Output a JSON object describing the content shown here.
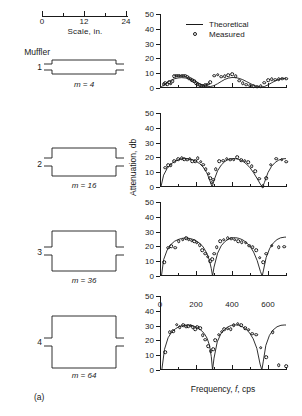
{
  "figure": {
    "panel_label": "(a)",
    "scale": {
      "title": "Scale, in.",
      "ticks": [
        0,
        12,
        24
      ],
      "tick_labels": [
        "0",
        "12",
        "24"
      ]
    },
    "muffler_header": "Muffler",
    "mufflers": [
      {
        "number": "1",
        "caption_prefix": "m",
        "caption_eq": " = 4",
        "m": 4
      },
      {
        "number": "2",
        "caption_prefix": "m",
        "caption_eq": " = 16",
        "m": 16
      },
      {
        "number": "3",
        "caption_prefix": "m",
        "caption_eq": " = 36",
        "m": 36
      },
      {
        "number": "4",
        "caption_prefix": "m",
        "caption_eq": " = 64",
        "m": 64
      }
    ],
    "legend": {
      "theoretical": "Theoretical",
      "measured": "Measured"
    },
    "axis_titles": {
      "y": "Attenuation, db",
      "x_prefix": "Frequency, ",
      "x_symbol": "f",
      "x_suffix": ", cps"
    }
  },
  "chart_data": [
    {
      "type": "line",
      "title": "",
      "panel_index": 1,
      "muffler": 1,
      "expansion_ratio_m": 4,
      "xlabel": "Frequency, f, cps",
      "ylabel": "Attenuation, db",
      "xlim": [
        0,
        700
      ],
      "ylim": [
        0,
        50
      ],
      "yticks": [
        0,
        10,
        20,
        30,
        40,
        50
      ],
      "xticks": [
        0,
        100,
        200,
        300,
        400,
        500,
        600,
        700
      ],
      "xticks_major": [
        0,
        200,
        400,
        600
      ],
      "grid": false,
      "legend": [
        "Theoretical",
        "Measured"
      ],
      "series": [
        {
          "name": "Theoretical",
          "style": "line",
          "x": [
            0,
            20,
            40,
            60,
            80,
            100,
            120,
            140,
            160,
            180,
            200,
            220,
            240,
            260,
            280,
            300,
            320,
            340,
            360,
            380,
            400,
            420,
            440,
            460,
            480,
            500,
            520,
            540,
            560,
            580,
            600,
            620,
            640,
            660,
            680,
            700
          ],
          "y": [
            0,
            2.0,
            3.8,
            5.2,
            6.2,
            6.8,
            7.0,
            6.8,
            6.3,
            5.4,
            4.2,
            3.0,
            1.9,
            1.2,
            1.0,
            1.6,
            2.9,
            4.4,
            5.8,
            6.7,
            7.1,
            7.0,
            6.5,
            5.6,
            4.4,
            3.1,
            1.9,
            1.0,
            0.6,
            1.0,
            2.1,
            3.5,
            4.8,
            5.8,
            6.4,
            6.6
          ]
        },
        {
          "name": "Measured",
          "style": "markers",
          "x": [
            20,
            30,
            40,
            50,
            60,
            70,
            80,
            90,
            100,
            110,
            120,
            130,
            140,
            150,
            160,
            170,
            180,
            190,
            200,
            210,
            220,
            230,
            240,
            250,
            260,
            270,
            280,
            300,
            320,
            340,
            360,
            380,
            400,
            420,
            440,
            460,
            480,
            500,
            520,
            540,
            560,
            580,
            600,
            620,
            640,
            660,
            680,
            700
          ],
          "y": [
            2.5,
            3.2,
            2.6,
            4.0,
            3.0,
            4.6,
            8.0,
            8.2,
            8.2,
            8.2,
            8.2,
            8.2,
            8.2,
            7.6,
            6.6,
            6.0,
            5.4,
            4.4,
            3.4,
            2.6,
            2.0,
            1.6,
            1.6,
            1.8,
            2.2,
            3.0,
            4.0,
            8.2,
            9.0,
            7.6,
            8.0,
            8.8,
            9.2,
            7.8,
            5.0,
            3.4,
            2.2,
            1.6,
            1.2,
            1.0,
            1.4,
            3.6,
            5.4,
            5.8,
            5.6,
            5.8,
            6.2,
            6.4
          ]
        }
      ]
    },
    {
      "type": "line",
      "title": "",
      "panel_index": 2,
      "muffler": 2,
      "expansion_ratio_m": 16,
      "xlabel": "Frequency, f, cps",
      "ylabel": "Attenuation, db",
      "xlim": [
        0,
        700
      ],
      "ylim": [
        0,
        50
      ],
      "yticks": [
        0,
        10,
        20,
        30,
        40,
        50
      ],
      "xticks": [
        0,
        100,
        200,
        300,
        400,
        500,
        600,
        700
      ],
      "xticks_major": [
        0,
        200,
        400,
        600
      ],
      "grid": false,
      "legend": [
        "Theoretical",
        "Measured"
      ],
      "series": [
        {
          "name": "Theoretical",
          "style": "line",
          "x": [
            5,
            20,
            40,
            60,
            80,
            100,
            120,
            140,
            160,
            180,
            200,
            220,
            240,
            260,
            275,
            285,
            290,
            300,
            320,
            340,
            360,
            380,
            400,
            420,
            440,
            460,
            480,
            500,
            520,
            540,
            560,
            570,
            580,
            600,
            620,
            640,
            660,
            680,
            700
          ],
          "y": [
            0,
            8.0,
            12.6,
            15.4,
            17.2,
            18.3,
            19.0,
            19.2,
            19.0,
            18.4,
            17.4,
            15.8,
            13.4,
            9.6,
            5.0,
            1.5,
            0,
            4.5,
            11.0,
            14.8,
            17.2,
            18.6,
            19.2,
            19.2,
            18.6,
            17.4,
            15.6,
            13.0,
            9.6,
            5.6,
            1.4,
            0,
            3.0,
            9.8,
            14.0,
            16.6,
            18.2,
            19.0,
            19.2
          ]
        },
        {
          "name": "Measured",
          "style": "markers",
          "x": [
            30,
            45,
            60,
            80,
            100,
            120,
            135,
            150,
            165,
            180,
            195,
            210,
            225,
            240,
            255,
            270,
            280,
            288,
            295,
            310,
            330,
            350,
            370,
            390,
            410,
            430,
            450,
            470,
            490,
            510,
            530,
            550,
            570,
            590,
            615,
            645,
            675,
            700
          ],
          "y": [
            13.0,
            14.8,
            14.8,
            17.6,
            18.6,
            19.6,
            18.6,
            18.4,
            19.0,
            17.4,
            17.6,
            19.6,
            17.0,
            15.0,
            12.0,
            9.0,
            6.0,
            3.0,
            4.8,
            12.0,
            17.6,
            17.8,
            19.0,
            18.4,
            18.4,
            20.0,
            18.0,
            17.8,
            16.6,
            14.2,
            10.6,
            5.6,
            0.5,
            5.8,
            15.2,
            19.0,
            18.4,
            17.0
          ]
        }
      ]
    },
    {
      "type": "line",
      "title": "",
      "panel_index": 3,
      "muffler": 3,
      "expansion_ratio_m": 36,
      "xlabel": "Frequency, f, cps",
      "ylabel": "Attenuation, db",
      "xlim": [
        0,
        700
      ],
      "ylim": [
        0,
        50
      ],
      "yticks": [
        0,
        10,
        20,
        30,
        40,
        50
      ],
      "xticks": [
        0,
        100,
        200,
        300,
        400,
        500,
        600,
        700
      ],
      "xticks_major": [
        0,
        200,
        400,
        600
      ],
      "grid": false,
      "legend": [
        "Theoretical",
        "Measured"
      ],
      "series": [
        {
          "name": "Theoretical",
          "style": "line",
          "x": [
            8,
            20,
            40,
            60,
            80,
            100,
            120,
            140,
            160,
            180,
            200,
            220,
            240,
            260,
            275,
            285,
            292,
            300,
            320,
            340,
            360,
            380,
            400,
            420,
            440,
            460,
            480,
            500,
            520,
            540,
            558,
            568,
            575,
            590,
            610,
            630,
            650,
            670,
            690,
            700
          ],
          "y": [
            0,
            11.0,
            17.6,
            21.2,
            23.4,
            24.6,
            25.4,
            25.7,
            25.5,
            24.9,
            23.8,
            22.2,
            19.6,
            15.4,
            10.4,
            5.0,
            0,
            6.0,
            15.4,
            20.4,
            23.2,
            25.0,
            25.8,
            25.9,
            25.4,
            24.4,
            22.6,
            20.0,
            16.2,
            10.4,
            3.0,
            0,
            4.0,
            12.6,
            18.8,
            22.4,
            24.6,
            25.8,
            26.2,
            26.3
          ]
        },
        {
          "name": "Measured",
          "style": "markers",
          "x": [
            22,
            45,
            62,
            85,
            105,
            125,
            145,
            160,
            175,
            190,
            205,
            220,
            235,
            250,
            265,
            278,
            290,
            300,
            315,
            335,
            355,
            375,
            395,
            415,
            435,
            455,
            475,
            495,
            515,
            535,
            555,
            572,
            590,
            620,
            660,
            690
          ],
          "y": [
            9.5,
            19.0,
            20.0,
            19.2,
            23.6,
            24.4,
            25.4,
            24.6,
            23.8,
            23.4,
            22.6,
            20.8,
            17.6,
            15.0,
            13.0,
            9.8,
            11.2,
            15.2,
            19.6,
            23.4,
            24.6,
            25.6,
            25.2,
            24.4,
            23.6,
            23.0,
            22.4,
            20.6,
            19.4,
            17.6,
            12.4,
            9.4,
            15.0,
            20.6,
            19.6,
            19.8
          ]
        }
      ]
    },
    {
      "type": "line",
      "title": "",
      "panel_index": 4,
      "muffler": 4,
      "expansion_ratio_m": 64,
      "xlabel": "Frequency, f, cps",
      "ylabel": "Attenuation, db",
      "xlim": [
        0,
        700
      ],
      "ylim": [
        0,
        50
      ],
      "yticks": [
        0,
        10,
        20,
        30,
        40,
        50
      ],
      "xticks": [
        0,
        100,
        200,
        300,
        400,
        500,
        600,
        700
      ],
      "xticks_major": [
        0,
        200,
        400,
        600
      ],
      "grid": false,
      "legend": [
        "Theoretical",
        "Measured"
      ],
      "series": [
        {
          "name": "Theoretical",
          "style": "line",
          "x": [
            10,
            25,
            45,
            65,
            85,
            105,
            125,
            145,
            165,
            185,
            205,
            225,
            245,
            262,
            275,
            285,
            292,
            300,
            318,
            338,
            358,
            378,
            398,
            418,
            438,
            458,
            478,
            498,
            518,
            538,
            556,
            566,
            574,
            588,
            608,
            628,
            650,
            672,
            690,
            700
          ],
          "y": [
            0,
            14.0,
            21.8,
            25.6,
            27.8,
            29.2,
            30.0,
            30.4,
            30.3,
            29.8,
            28.8,
            27.2,
            24.8,
            21.4,
            16.6,
            9.0,
            0,
            8.0,
            19.0,
            24.4,
            27.4,
            29.2,
            30.2,
            30.5,
            30.2,
            29.2,
            27.6,
            25.0,
            21.0,
            14.6,
            4.0,
            0,
            6.0,
            16.6,
            23.4,
            27.0,
            29.2,
            30.2,
            30.4,
            30.4
          ]
        },
        {
          "name": "Measured",
          "style": "markers",
          "x": [
            30,
            55,
            72,
            92,
            110,
            128,
            145,
            158,
            170,
            182,
            195,
            208,
            222,
            238,
            252,
            268,
            282,
            295,
            308,
            325,
            342,
            358,
            375,
            392,
            410,
            432,
            452,
            472,
            492,
            512,
            535,
            560,
            590,
            625,
            660,
            700
          ],
          "y": [
            12.0,
            25.4,
            26.4,
            30.6,
            29.0,
            30.4,
            29.2,
            29.6,
            30.0,
            28.8,
            27.6,
            29.0,
            28.2,
            23.6,
            20.4,
            16.2,
            12.6,
            14.0,
            20.2,
            23.8,
            26.0,
            27.4,
            28.0,
            27.6,
            30.2,
            31.2,
            30.4,
            28.4,
            27.2,
            24.4,
            23.8,
            15.0,
            8.8,
            25.6,
            3.2,
            2.6
          ]
        }
      ]
    }
  ]
}
